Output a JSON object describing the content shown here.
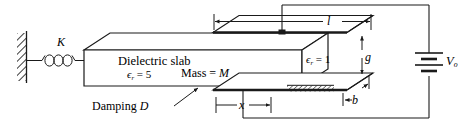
{
  "figure": {
    "name": "dielectric-slab-capacitor-diagram",
    "stroke_color": "#1a1a1a",
    "fill_color": "#ffffff"
  },
  "labels": {
    "spring_constant": "K",
    "slab_title": "Dielectric slab",
    "slab_permittivity_symbol": "ϵ",
    "slab_permittivity_subscript": "r",
    "slab_permittivity_eq": "= 5",
    "slab_mass": "Mass = ",
    "slab_mass_value": "M",
    "damping": "Damping ",
    "damping_value": "D",
    "displacement": "x",
    "plate_length": "l",
    "gap": "g",
    "plate_thickness": "b",
    "air_permittivity_symbol": "ϵ",
    "air_permittivity_subscript": "r",
    "air_permittivity_eq": "= 1",
    "source_voltage": "V",
    "source_voltage_subscript": "o"
  },
  "components": {
    "wall": "fixed-wall-hatched",
    "spring": "coil-spring",
    "slab": "dielectric-slab-block",
    "top_plate": "upper-capacitor-plate",
    "bottom_plate": "lower-capacitor-plate",
    "battery": "dc-voltage-source",
    "terminal": "wire-junction-dot",
    "hatch_pad": "hatched-pad-on-lower-plate"
  }
}
